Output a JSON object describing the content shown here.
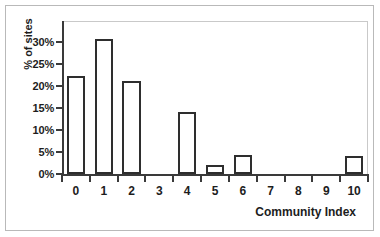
{
  "chart_data": {
    "type": "bar",
    "title": "",
    "xlabel": "Community Index",
    "ylabel": "% of sites",
    "categories": [
      "0",
      "1",
      "2",
      "3",
      "4",
      "5",
      "6",
      "7",
      "8",
      "9",
      "10"
    ],
    "values": [
      22.3,
      30.6,
      21.1,
      0,
      14.0,
      2.0,
      4.4,
      0,
      0,
      0,
      4.2
    ],
    "ytick_labels": [
      "0%",
      "5%",
      "10%",
      "15%",
      "20%",
      "25%",
      "30%"
    ],
    "ytick_values": [
      0,
      5,
      10,
      15,
      20,
      25,
      30
    ],
    "ylim": [
      0,
      35
    ],
    "xlim": [
      -0.5,
      10.5
    ],
    "grid": false,
    "legend": false,
    "bar_fill_color": "#ffffff",
    "bar_edge_color": "#2e2e2e",
    "axis_color": "#3a3a3a",
    "frame_color": "#c9c9c9",
    "border_color": "#b9b9b9",
    "text_color": "#1d1d1d"
  }
}
